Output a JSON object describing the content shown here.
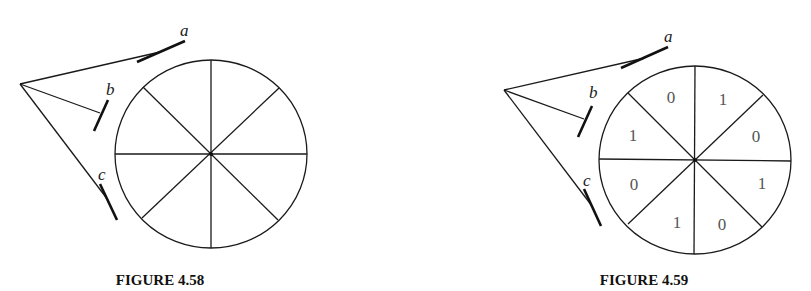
{
  "figures": [
    {
      "caption": "FIGURE 4.58",
      "labels": {
        "a": "a",
        "b": "b",
        "c": "c"
      },
      "sector_digits": []
    },
    {
      "caption": "FIGURE 4.59",
      "labels": {
        "a": "a",
        "b": "b",
        "c": "c"
      },
      "sector_digits": {
        "top_left": "0",
        "top_right": "1",
        "right_upper": "0",
        "right_lower": "1",
        "bottom_right": "0",
        "bottom_left": "1",
        "left_lower": "0",
        "left_upper": "1"
      }
    }
  ],
  "colors": {
    "line": "#1a1a1a",
    "digit": "#555555",
    "background": "#ffffff"
  }
}
